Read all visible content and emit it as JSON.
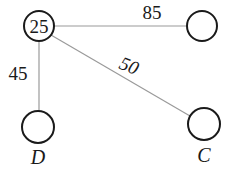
{
  "diagram": {
    "type": "graph",
    "nodes": [
      {
        "id": "n1",
        "value": "25",
        "label": ""
      },
      {
        "id": "n2",
        "value": "",
        "label": ""
      },
      {
        "id": "n3",
        "value": "",
        "label": "D"
      },
      {
        "id": "n4",
        "value": "",
        "label": "C"
      }
    ],
    "edges": [
      {
        "from": "n1",
        "to": "n2",
        "weight": "85"
      },
      {
        "from": "n1",
        "to": "n3",
        "weight": "45"
      },
      {
        "from": "n1",
        "to": "n4",
        "weight": "50"
      }
    ],
    "colors": {
      "edge": "#9a9a9a",
      "node_stroke": "#1a1a1a",
      "text": "#1a1a1a",
      "background": "#ffffff"
    }
  }
}
